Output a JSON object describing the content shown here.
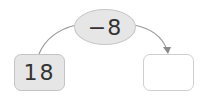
{
  "diagram": {
    "start_value": "18",
    "operation": "−8",
    "result_value": "",
    "colors": {
      "filled_box": "#e6e6e6",
      "border": "#c4c4c4",
      "arrow": "#8a8a8a",
      "text": "#333333"
    }
  }
}
